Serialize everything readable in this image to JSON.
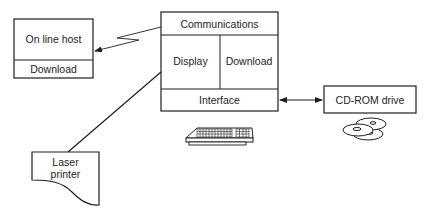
{
  "diagram": {
    "online_host": {
      "title": "On line host",
      "section": "Download"
    },
    "computer": {
      "top": "Communications",
      "left": "Display",
      "right": "Download",
      "bottom": "Interface"
    },
    "cdrom": {
      "label": "CD-ROM drive"
    },
    "printer": {
      "label_line1": "Laser",
      "label_line2": "printer"
    },
    "icons": {
      "keyboard": "keyboard-icon",
      "discs": "cd-discs-icon"
    },
    "connections": [
      {
        "from": "Communications",
        "to": "On line host",
        "style": "zigzag-arrow"
      },
      {
        "from": "Interface",
        "to": "CD-ROM drive",
        "style": "double-arrow"
      },
      {
        "from": "computer",
        "to": "Laser printer",
        "style": "line"
      }
    ],
    "colors": {
      "stroke": "#1e1e1e",
      "background": "#ffffff"
    }
  }
}
